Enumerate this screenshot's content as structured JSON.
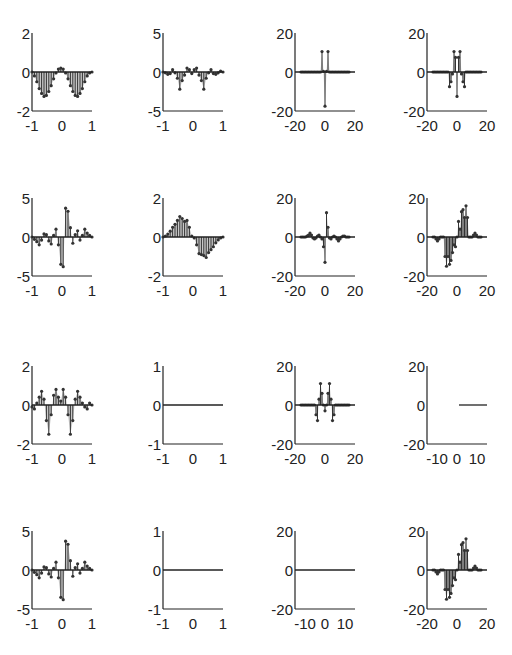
{
  "figure": {
    "width": 512,
    "height": 655,
    "rows": 4,
    "cols": 4,
    "stem_color": "#333333",
    "fill_color": "#9a9a9a",
    "axis_color": "#222222"
  },
  "chart_data": [
    {
      "id": "r1c1",
      "type": "stem",
      "row": 0,
      "col": 0,
      "title": "",
      "xlabel": "",
      "ylabel": "",
      "xlim": [
        -1,
        1
      ],
      "ylim": [
        -2,
        2
      ],
      "xticks": [
        "-1",
        "0",
        "1"
      ],
      "yticks": [
        "-2",
        "0",
        "2"
      ],
      "x": [
        -1.0,
        -0.92,
        -0.84,
        -0.76,
        -0.68,
        -0.6,
        -0.52,
        -0.44,
        -0.36,
        -0.28,
        -0.2,
        -0.12,
        -0.04,
        0.04,
        0.12,
        0.2,
        0.28,
        0.36,
        0.44,
        0.52,
        0.6,
        0.68,
        0.76,
        0.84,
        0.92,
        1.0
      ],
      "values": [
        0,
        -0.2,
        -0.5,
        -0.85,
        -1.1,
        -1.25,
        -1.2,
        -1.0,
        -0.7,
        -0.35,
        -0.05,
        0.15,
        0.2,
        0.15,
        -0.05,
        -0.35,
        -0.7,
        -1.0,
        -1.2,
        -1.25,
        -1.1,
        -0.85,
        -0.5,
        -0.2,
        -0.05,
        0
      ]
    },
    {
      "id": "r1c2",
      "type": "stem",
      "row": 0,
      "col": 1,
      "xlim": [
        -1,
        1
      ],
      "ylim": [
        -5,
        5
      ],
      "xticks": [
        "-1",
        "0",
        "1"
      ],
      "yticks": [
        "-5",
        "0",
        "5"
      ],
      "x": [
        -1.0,
        -0.92,
        -0.84,
        -0.76,
        -0.68,
        -0.6,
        -0.52,
        -0.44,
        -0.36,
        -0.28,
        -0.2,
        -0.12,
        -0.04,
        0.04,
        0.12,
        0.2,
        0.28,
        0.36,
        0.44,
        0.52,
        0.6,
        0.68,
        0.76,
        0.84,
        0.92,
        1.0
      ],
      "values": [
        0,
        -0.1,
        -0.3,
        -0.2,
        0.3,
        -0.1,
        -0.8,
        -2.2,
        -1.1,
        -0.4,
        0.5,
        0.3,
        -0.2,
        0.3,
        0.5,
        -0.4,
        -1.1,
        -2.2,
        -0.8,
        -0.1,
        0.3,
        -0.2,
        -0.3,
        -0.1,
        0.1,
        0
      ]
    },
    {
      "id": "r1c3",
      "type": "stem",
      "row": 0,
      "col": 2,
      "xlim": [
        -20,
        20
      ],
      "ylim": [
        -20,
        20
      ],
      "xticks": [
        "-20",
        "0",
        "20"
      ],
      "yticks": [
        "-20",
        "0",
        "20"
      ],
      "x": [
        -16,
        -15,
        -14,
        -13,
        -12,
        -11,
        -10,
        -9,
        -8,
        -7,
        -6,
        -5,
        -4,
        -3,
        -2,
        -1,
        0,
        1,
        2,
        3,
        4,
        5,
        6,
        7,
        8,
        9,
        10,
        11,
        12,
        13,
        14,
        15,
        16
      ],
      "values": [
        0,
        0,
        0,
        0,
        0,
        0,
        0,
        0,
        0,
        0,
        0,
        0,
        0,
        0,
        10.5,
        0.3,
        -17.5,
        0.3,
        10.5,
        0,
        0,
        0,
        0,
        0,
        0,
        0,
        0,
        0,
        0,
        0,
        0,
        0,
        0
      ]
    },
    {
      "id": "r1c4",
      "type": "stem",
      "row": 0,
      "col": 3,
      "xlim": [
        -20,
        20
      ],
      "ylim": [
        -20,
        20
      ],
      "xticks": [
        "-20",
        "0",
        "20"
      ],
      "yticks": [
        "-20",
        "0",
        "20"
      ],
      "x": [
        -16,
        -15,
        -14,
        -13,
        -12,
        -11,
        -10,
        -9,
        -8,
        -7,
        -6,
        -5,
        -4,
        -3,
        -2,
        -1,
        0,
        1,
        2,
        3,
        4,
        5,
        6,
        7,
        8,
        9,
        10,
        11,
        12,
        13,
        14,
        15,
        16
      ],
      "values": [
        0,
        0,
        0,
        0,
        0,
        0,
        0,
        0,
        0,
        0,
        0,
        -7.5,
        -5,
        -1,
        10.5,
        7.5,
        -12.5,
        7.5,
        10.5,
        -1,
        -5,
        -7.5,
        0,
        0,
        0,
        0,
        0,
        0,
        0,
        0,
        0,
        0,
        0
      ]
    },
    {
      "id": "r2c1",
      "type": "stem",
      "row": 1,
      "col": 0,
      "xlim": [
        -1,
        1
      ],
      "ylim": [
        -5,
        5
      ],
      "xticks": [
        "-1",
        "0",
        "1"
      ],
      "yticks": [
        "-5",
        "0",
        "5"
      ],
      "x": [
        -1.0,
        -0.92,
        -0.84,
        -0.76,
        -0.68,
        -0.6,
        -0.52,
        -0.44,
        -0.36,
        -0.28,
        -0.2,
        -0.12,
        -0.04,
        0.04,
        0.12,
        0.2,
        0.28,
        0.36,
        0.44,
        0.52,
        0.6,
        0.68,
        0.76,
        0.84,
        0.92,
        1.0
      ],
      "values": [
        0,
        -0.3,
        -0.6,
        -1.0,
        -0.4,
        0.4,
        0.3,
        -0.5,
        -0.9,
        0.2,
        1.0,
        -1.0,
        -3.5,
        -3.8,
        3.7,
        3.3,
        1.2,
        -0.8,
        0.3,
        0.8,
        -0.4,
        0.2,
        1.0,
        0.5,
        0.2,
        0
      ]
    },
    {
      "id": "r2c2",
      "type": "stem",
      "row": 1,
      "col": 1,
      "xlim": [
        -1,
        1
      ],
      "ylim": [
        -2,
        2
      ],
      "xticks": [
        "-1",
        "0",
        "1"
      ],
      "yticks": [
        "-2",
        "0",
        "2"
      ],
      "x": [
        -1.0,
        -0.92,
        -0.84,
        -0.76,
        -0.68,
        -0.6,
        -0.52,
        -0.44,
        -0.36,
        -0.28,
        -0.2,
        -0.12,
        -0.04,
        0.04,
        0.12,
        0.2,
        0.28,
        0.36,
        0.44,
        0.52,
        0.6,
        0.68,
        0.76,
        0.84,
        0.92,
        1.0
      ],
      "values": [
        0,
        0.05,
        0.15,
        0.3,
        0.5,
        0.65,
        0.85,
        1.05,
        0.95,
        0.8,
        0.85,
        0.5,
        0.05,
        -0.05,
        -0.4,
        -0.85,
        -0.9,
        -0.95,
        -1.05,
        -0.8,
        -0.65,
        -0.5,
        -0.3,
        -0.15,
        -0.05,
        0
      ]
    },
    {
      "id": "r2c3",
      "type": "stem",
      "row": 1,
      "col": 2,
      "xlim": [
        -20,
        20
      ],
      "ylim": [
        -20,
        20
      ],
      "xticks": [
        "-20",
        "0",
        "20"
      ],
      "yticks": [
        "-20",
        "0",
        "20"
      ],
      "x": [
        -16,
        -15,
        -14,
        -13,
        -12,
        -11,
        -10,
        -9,
        -8,
        -7,
        -6,
        -5,
        -4,
        -3,
        -2,
        -1,
        0,
        1,
        2,
        3,
        4,
        5,
        6,
        7,
        8,
        9,
        10,
        11,
        12,
        13,
        14,
        15,
        16
      ],
      "values": [
        0,
        0,
        0,
        0,
        0.5,
        1,
        2,
        1,
        -0.5,
        -1,
        -0.5,
        0.5,
        1,
        0,
        -1,
        -5,
        -13,
        12.5,
        5,
        -0.5,
        -1,
        0,
        0.5,
        0,
        -1,
        -2,
        -1,
        0,
        0.5,
        0.5,
        0,
        0,
        0
      ]
    },
    {
      "id": "r2c4",
      "type": "stem",
      "row": 1,
      "col": 3,
      "xlim": [
        -20,
        20
      ],
      "ylim": [
        -20,
        20
      ],
      "xticks": [
        "-20",
        "0",
        "20"
      ],
      "yticks": [
        "-20",
        "0",
        "20"
      ],
      "x": [
        -16,
        -15,
        -14,
        -13,
        -12,
        -11,
        -10,
        -9,
        -8,
        -7,
        -6,
        -5,
        -4,
        -3,
        -2,
        -1,
        0,
        1,
        2,
        3,
        4,
        5,
        6,
        7,
        8,
        9,
        10,
        11,
        12,
        13,
        14,
        15,
        16
      ],
      "values": [
        0,
        0,
        -1,
        -2,
        -1,
        0,
        0,
        0,
        -10,
        -15,
        -10,
        -14,
        -12,
        -8,
        -4,
        -5,
        0,
        8,
        4,
        13,
        14,
        10,
        16,
        10,
        0,
        0,
        0,
        1,
        2,
        1,
        0,
        0,
        0
      ]
    },
    {
      "id": "r3c1",
      "type": "stem",
      "row": 2,
      "col": 0,
      "xlim": [
        -1,
        1
      ],
      "ylim": [
        -2,
        2
      ],
      "xticks": [
        "-1",
        "0",
        "1"
      ],
      "yticks": [
        "-2",
        "0",
        "2"
      ],
      "x": [
        -1.0,
        -0.92,
        -0.84,
        -0.76,
        -0.68,
        -0.6,
        -0.52,
        -0.44,
        -0.36,
        -0.28,
        -0.2,
        -0.12,
        -0.04,
        0.04,
        0.12,
        0.2,
        0.28,
        0.36,
        0.44,
        0.52,
        0.6,
        0.68,
        0.76,
        0.84,
        0.92,
        1.0
      ],
      "values": [
        -0.1,
        -0.2,
        0.1,
        0.4,
        0.7,
        0.3,
        -0.8,
        -1.5,
        -0.5,
        0.5,
        0.8,
        0.4,
        0.2,
        0.8,
        0.4,
        -0.5,
        -1.5,
        -0.8,
        0.3,
        0.7,
        0.4,
        0.1,
        -0.1,
        -0.2,
        0.1,
        0
      ]
    },
    {
      "id": "r3c2",
      "type": "line",
      "row": 2,
      "col": 1,
      "xlim": [
        -1,
        1
      ],
      "ylim": [
        -1,
        1
      ],
      "xticks": [
        "-1",
        "0",
        "1"
      ],
      "yticks": [
        "-1",
        "0",
        "1"
      ],
      "x": [
        -1,
        1
      ],
      "values": [
        0,
        0
      ]
    },
    {
      "id": "r3c3",
      "type": "stem",
      "row": 2,
      "col": 2,
      "xlim": [
        -20,
        20
      ],
      "ylim": [
        -20,
        20
      ],
      "xticks": [
        "-20",
        "0",
        "20"
      ],
      "yticks": [
        "-20",
        "0",
        "20"
      ],
      "x": [
        -16,
        -15,
        -14,
        -13,
        -12,
        -11,
        -10,
        -9,
        -8,
        -7,
        -6,
        -5,
        -4,
        -3,
        -2,
        -1,
        0,
        1,
        2,
        3,
        4,
        5,
        6,
        7,
        8,
        9,
        10,
        11,
        12,
        13,
        14,
        15,
        16
      ],
      "values": [
        0,
        0,
        0,
        0,
        0,
        0,
        0,
        0,
        0,
        0,
        -5,
        -8,
        3,
        11,
        6,
        0,
        -3,
        0,
        6,
        11,
        3,
        -8,
        -5,
        0,
        0,
        0,
        0,
        0,
        0,
        0,
        0,
        0,
        0
      ]
    },
    {
      "id": "r3c4",
      "type": "line",
      "row": 2,
      "col": 3,
      "xlim": [
        -15,
        15
      ],
      "ylim": [
        -20,
        20
      ],
      "xticks": [
        "-10",
        "0",
        "10"
      ],
      "yticks": [
        "-20",
        "0",
        "20"
      ],
      "x": [
        1,
        15
      ],
      "values": [
        0,
        0
      ]
    },
    {
      "id": "r4c1",
      "type": "stem",
      "row": 3,
      "col": 0,
      "xlim": [
        -1,
        1
      ],
      "ylim": [
        -5,
        5
      ],
      "xticks": [
        "-1",
        "0",
        "1"
      ],
      "yticks": [
        "-5",
        "0",
        "5"
      ],
      "x": [
        -1.0,
        -0.92,
        -0.84,
        -0.76,
        -0.68,
        -0.6,
        -0.52,
        -0.44,
        -0.36,
        -0.28,
        -0.2,
        -0.12,
        -0.04,
        0.04,
        0.12,
        0.2,
        0.28,
        0.36,
        0.44,
        0.52,
        0.6,
        0.68,
        0.76,
        0.84,
        0.92,
        1.0
      ],
      "values": [
        0,
        -0.3,
        -0.6,
        -1.0,
        -0.4,
        0.4,
        0.3,
        -0.5,
        -0.9,
        0.2,
        1.0,
        -1.0,
        -3.5,
        -3.8,
        3.7,
        3.3,
        1.2,
        -0.8,
        0.3,
        0.8,
        -0.4,
        0.2,
        1.0,
        0.5,
        0.2,
        0
      ]
    },
    {
      "id": "r4c2",
      "type": "line",
      "row": 3,
      "col": 1,
      "xlim": [
        -1,
        1
      ],
      "ylim": [
        -1,
        1
      ],
      "xticks": [
        "-1",
        "0",
        "1"
      ],
      "yticks": [
        "-1",
        "0",
        "1"
      ],
      "x": [
        -1,
        1
      ],
      "values": [
        0,
        0
      ]
    },
    {
      "id": "r4c3",
      "type": "line",
      "row": 3,
      "col": 2,
      "xlim": [
        -15,
        15
      ],
      "ylim": [
        -20,
        20
      ],
      "xticks": [
        "-10",
        "0",
        "10"
      ],
      "yticks": [
        "-20",
        "0",
        "20"
      ],
      "x": [
        -15,
        15
      ],
      "values": [
        0,
        0
      ]
    },
    {
      "id": "r4c4",
      "type": "stem",
      "row": 3,
      "col": 3,
      "xlim": [
        -20,
        20
      ],
      "ylim": [
        -20,
        20
      ],
      "xticks": [
        "-20",
        "0",
        "20"
      ],
      "yticks": [
        "-20",
        "0",
        "20"
      ],
      "x": [
        -16,
        -15,
        -14,
        -13,
        -12,
        -11,
        -10,
        -9,
        -8,
        -7,
        -6,
        -5,
        -4,
        -3,
        -2,
        -1,
        0,
        1,
        2,
        3,
        4,
        5,
        6,
        7,
        8,
        9,
        10,
        11,
        12,
        13,
        14,
        15,
        16
      ],
      "values": [
        0,
        0,
        -1,
        -2,
        -1,
        0,
        0,
        0,
        -10,
        -15,
        -10,
        -14,
        -12,
        -8,
        -4,
        -5,
        0,
        8,
        4,
        13,
        14,
        10,
        16,
        10,
        0,
        0,
        0,
        1,
        2,
        1,
        0,
        0,
        0
      ]
    }
  ]
}
